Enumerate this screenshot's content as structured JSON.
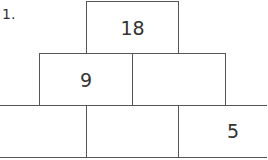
{
  "problem": {
    "number_label": "1."
  },
  "pyramid": {
    "top": [
      {
        "value": "18"
      }
    ],
    "middle": [
      {
        "value": "9"
      },
      {
        "value": ""
      }
    ],
    "bottom": [
      {
        "value": ""
      },
      {
        "value": ""
      },
      {
        "value": "5"
      }
    ]
  }
}
